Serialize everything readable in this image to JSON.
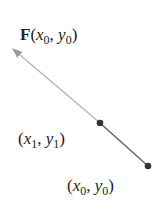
{
  "diagram": {
    "vector_label": {
      "func": "F",
      "open": "(",
      "x": "x",
      "xsub": "0",
      "sep": ", ",
      "y": "y",
      "ysub": "0",
      "close": ")"
    },
    "point1_label": {
      "open": "(",
      "x": "x",
      "xsub": "1",
      "sep": ", ",
      "y": "y",
      "ysub": "1",
      "close": ")"
    },
    "point0_label": {
      "open": "(",
      "x": "x",
      "xsub": "0",
      "sep": ", ",
      "y": "y",
      "ysub": "0",
      "close": ")"
    },
    "colors": {
      "arrow": "#aaaaaa",
      "segment": "#555555",
      "point": "#333333",
      "text": "#222222"
    }
  }
}
